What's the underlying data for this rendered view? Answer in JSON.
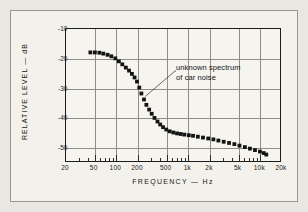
{
  "figure": {
    "x_axis_title": "FREQUENCY — Hz",
    "y_axis_title": "RELATIVE LEVEL — dB",
    "annotation_line1": "unknown spectrum",
    "annotation_line2": "of car noise"
  },
  "chart_data": {
    "type": "scatter",
    "title": "",
    "xlabel": "FREQUENCY — Hz",
    "ylabel": "RELATIVE LEVEL — dB",
    "xscale": "log",
    "xlim": [
      20,
      20000
    ],
    "ylim": [
      -55,
      -10
    ],
    "grid": true,
    "legend": null,
    "xticks": [
      20,
      50,
      100,
      200,
      500,
      1000,
      2000,
      5000,
      10000,
      20000
    ],
    "xtick_labels": [
      "20",
      "50",
      "100",
      "200",
      "500",
      "1k",
      "2k",
      "5k",
      "10k",
      "20k"
    ],
    "yticks": [
      -10,
      -20,
      -30,
      -40,
      -50
    ],
    "ytick_labels": [
      "-10",
      "-20",
      "-30",
      "-40",
      "-50"
    ],
    "annotations": [
      {
        "text": "unknown spectrum of car noise",
        "text_x": 2400,
        "text_y": -28,
        "point_x": 260,
        "point_y": -33
      }
    ],
    "series": [
      {
        "name": "unknown spectrum of car noise",
        "marker": "square",
        "color": "#141414",
        "x": [
          45,
          52,
          60,
          68,
          78,
          88,
          100,
          112,
          125,
          140,
          155,
          170,
          185,
          200,
          215,
          230,
          250,
          270,
          295,
          320,
          350,
          385,
          420,
          460,
          510,
          570,
          640,
          720,
          810,
          910,
          1050,
          1200,
          1400,
          1650,
          1950,
          2300,
          2700,
          3200,
          3800,
          4500,
          5300,
          6300,
          7400,
          8700,
          10200,
          11500,
          12500
        ],
        "y": [
          -18.2,
          -18.2,
          -18.3,
          -18.6,
          -19.0,
          -19.5,
          -20.2,
          -21.2,
          -22.2,
          -23.3,
          -24.3,
          -25.4,
          -26.6,
          -28.0,
          -30.0,
          -32.0,
          -34.0,
          -35.8,
          -37.4,
          -38.8,
          -40.2,
          -41.4,
          -42.4,
          -43.3,
          -44.1,
          -44.7,
          -45.1,
          -45.4,
          -45.6,
          -45.8,
          -46.0,
          -46.2,
          -46.5,
          -46.8,
          -47.1,
          -47.4,
          -47.8,
          -48.2,
          -48.6,
          -49.0,
          -49.5,
          -50.0,
          -50.5,
          -51.0,
          -51.5,
          -52.0,
          -52.5
        ]
      }
    ]
  }
}
